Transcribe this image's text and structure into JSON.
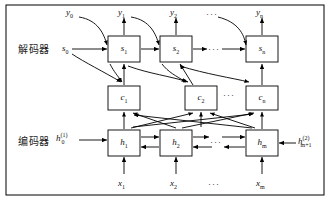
{
  "figure": {
    "border_color": "#000000",
    "line_color": "#000000",
    "box_fill": "#ffffff"
  },
  "row_labels": {
    "decoder": "解码器",
    "encoder": "编码器"
  },
  "decoder_row": {
    "initial_state": "s",
    "initial_state_sub": "0",
    "boxes": [
      {
        "base": "s",
        "sub": "1"
      },
      {
        "base": "s",
        "sub": "2"
      },
      {
        "base": "s",
        "sub": "n"
      }
    ],
    "ellipsis": "···"
  },
  "outputs": {
    "labels": [
      {
        "base": "y",
        "sub": "0"
      },
      {
        "base": "y",
        "sub": "1"
      },
      {
        "base": "y",
        "sub": "2"
      },
      {
        "base": "y",
        "sub": "n"
      }
    ],
    "ellipsis": "···"
  },
  "context_row": {
    "boxes": [
      {
        "base": "c",
        "sub": "1"
      },
      {
        "base": "c",
        "sub": "2"
      },
      {
        "base": "c",
        "sub": "n"
      }
    ],
    "ellipsis": "···"
  },
  "encoder_row": {
    "initial_state": {
      "base": "h",
      "sub": "0",
      "sup": "(1)"
    },
    "final_state": {
      "base": "h",
      "sub": "m+1",
      "sup": "(2)"
    },
    "boxes": [
      {
        "base": "h",
        "sub": "1"
      },
      {
        "base": "h",
        "sub": "2"
      },
      {
        "base": "h",
        "sub": "m"
      }
    ],
    "ellipsis": "···"
  },
  "inputs": {
    "labels": [
      {
        "base": "x",
        "sub": "1"
      },
      {
        "base": "x",
        "sub": "2"
      },
      {
        "base": "x",
        "sub": "m"
      }
    ],
    "ellipsis": "···"
  }
}
